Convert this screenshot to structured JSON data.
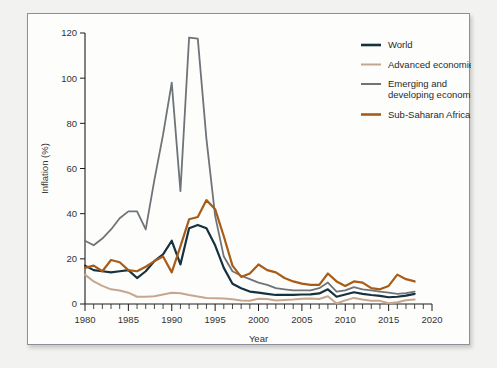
{
  "chart_data": {
    "type": "line",
    "title": "",
    "xlabel": "Year",
    "ylabel": "Inflation (%)",
    "xlim": [
      1980,
      2020
    ],
    "ylim": [
      0,
      120
    ],
    "yticks": [
      0,
      20,
      40,
      60,
      80,
      100,
      120
    ],
    "xticks": [
      1980,
      1985,
      1990,
      1995,
      2000,
      2005,
      2010,
      2015,
      2020
    ],
    "minor_x_tick_step": 1,
    "grid": false,
    "legend_position": "top-right",
    "x": [
      1980,
      1981,
      1982,
      1983,
      1984,
      1985,
      1986,
      1987,
      1988,
      1989,
      1990,
      1991,
      1992,
      1993,
      1994,
      1995,
      1996,
      1997,
      1998,
      1999,
      2000,
      2001,
      2002,
      2003,
      2004,
      2005,
      2006,
      2007,
      2008,
      2009,
      2010,
      2011,
      2012,
      2013,
      2014,
      2015,
      2016,
      2017,
      2018
    ],
    "series": [
      {
        "name": "World",
        "color": "#16323f",
        "width": 2.2,
        "values": [
          17.0,
          15.0,
          14.5,
          14.0,
          14.5,
          15.0,
          11.5,
          14.5,
          19.0,
          22.0,
          28.0,
          17.5,
          33.5,
          35.0,
          33.5,
          26.0,
          16.0,
          9.0,
          7.0,
          5.5,
          5.0,
          4.5,
          4.0,
          4.0,
          4.0,
          4.2,
          4.3,
          4.7,
          6.5,
          3.2,
          4.2,
          5.2,
          4.5,
          4.0,
          3.6,
          3.0,
          3.2,
          3.7,
          4.5
        ]
      },
      {
        "name": "Advanced economies",
        "color": "#c7a690",
        "width": 2.0,
        "values": [
          13.0,
          10.0,
          8.0,
          6.5,
          6.0,
          5.0,
          3.2,
          3.2,
          3.4,
          4.2,
          5.0,
          4.8,
          4.0,
          3.3,
          2.7,
          2.6,
          2.4,
          2.1,
          1.6,
          1.4,
          2.3,
          2.2,
          1.6,
          1.8,
          2.0,
          2.3,
          2.4,
          2.2,
          3.4,
          0.2,
          1.6,
          2.7,
          2.0,
          1.4,
          1.4,
          0.3,
          0.8,
          1.7,
          2.0
        ]
      },
      {
        "name": "Emerging and developing economies",
        "color": "#6f7479",
        "width": 1.8,
        "values": [
          28.0,
          26.0,
          29.0,
          33.0,
          38.0,
          41.0,
          41.0,
          33.0,
          55.0,
          75.0,
          98.0,
          50.0,
          118.0,
          117.5,
          73.0,
          39.0,
          21.0,
          14.5,
          12.5,
          11.0,
          9.5,
          8.5,
          7.0,
          6.5,
          6.0,
          6.0,
          6.0,
          7.0,
          9.5,
          5.5,
          6.0,
          7.5,
          6.5,
          6.0,
          5.5,
          5.0,
          4.5,
          4.8,
          5.5
        ]
      },
      {
        "name": "Sub-Saharan Africa",
        "color": "#a85c18",
        "width": 2.2,
        "values": [
          16.0,
          17.0,
          14.5,
          19.5,
          18.5,
          15.0,
          14.5,
          16.5,
          19.0,
          21.0,
          14.0,
          25.5,
          37.5,
          38.5,
          46.0,
          42.0,
          30.0,
          17.0,
          12.0,
          13.5,
          17.5,
          15.0,
          14.0,
          11.5,
          10.0,
          9.0,
          8.5,
          8.5,
          13.5,
          10.0,
          8.0,
          10.0,
          9.5,
          7.0,
          6.5,
          8.0,
          13.0,
          11.0,
          10.0
        ]
      }
    ]
  },
  "legend": {
    "items": [
      {
        "label": "World",
        "color": "#16323f"
      },
      {
        "label": "Advanced economies",
        "color": "#c7a690"
      },
      {
        "label": "Emerging and",
        "label2": "developing economies",
        "color": "#6f7479"
      },
      {
        "label": "Sub-Saharan Africa",
        "color": "#a85c18"
      }
    ]
  },
  "axes": {
    "y_label": "Inflation (%)",
    "x_label": "Year",
    "y_tick_labels": [
      "0",
      "20",
      "40",
      "60",
      "80",
      "100",
      "120"
    ],
    "x_tick_labels": [
      "1980",
      "1985",
      "1990",
      "1995",
      "2000",
      "2005",
      "2010",
      "2015",
      "2020"
    ]
  }
}
